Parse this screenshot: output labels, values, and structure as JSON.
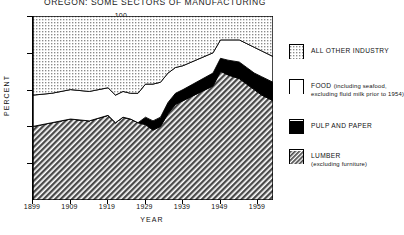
{
  "title": "OREGON: SOME SECTORS OF MANUFACTURING",
  "axes": {
    "ylabel": "PERCENT",
    "xlabel": "YEAR",
    "yticks": [
      "20",
      "40",
      "60",
      "80",
      "100"
    ],
    "xticks": [
      "1899",
      "1909",
      "1919",
      "1929",
      "1939",
      "1949",
      "1959"
    ]
  },
  "legend": [
    {
      "label": "ALL OTHER  INDUSTRY",
      "sub": "",
      "swatch": "light-dotted",
      "color": "#d9d9d9"
    },
    {
      "label": "FOOD",
      "sub": "(including seafood,",
      "sub2": "excluding  fluid milk prior to 1954)",
      "swatch": "white",
      "color": "#ffffff"
    },
    {
      "label": "PULP  AND  PAPER",
      "sub": "",
      "swatch": "solid-black",
      "color": "#000000"
    },
    {
      "label": "LUMBER",
      "sub": "(excluding furniture)",
      "swatch": "dark-hatch",
      "color": "#8f8f8f"
    }
  ],
  "chart_data": {
    "type": "area",
    "title": "OREGON: SOME SECTORS OF MANUFACTURING",
    "xlabel": "YEAR",
    "ylabel": "PERCENT",
    "xlim": [
      1899,
      1963
    ],
    "ylim": [
      0,
      100
    ],
    "grid": false,
    "stacked": true,
    "stack_total": 100,
    "legend_position": "right",
    "x": [
      1899,
      1904,
      1909,
      1914,
      1919,
      1921,
      1923,
      1925,
      1927,
      1929,
      1931,
      1933,
      1935,
      1937,
      1939,
      1947,
      1949,
      1951,
      1954,
      1956,
      1958,
      1960,
      1963
    ],
    "series": [
      {
        "name": "LUMBER (excluding furniture)",
        "values": [
          40,
          42,
          44,
          43,
          46,
          42,
          45,
          44,
          42,
          41,
          38,
          40,
          47,
          52,
          54,
          62,
          70,
          68,
          66,
          63,
          60,
          57,
          54
        ]
      },
      {
        "name": "PULP AND PAPER",
        "values": [
          0,
          0,
          0,
          0,
          0,
          0,
          0,
          0,
          0,
          4,
          5,
          5,
          6,
          6,
          6,
          7,
          7,
          8,
          9,
          9,
          9,
          10,
          10
        ]
      },
      {
        "name": "FOOD (including seafood, excluding fluid milk prior to 1954)",
        "values": [
          17,
          16,
          16,
          16,
          15,
          15,
          14,
          14,
          16,
          18,
          20,
          19,
          16,
          14,
          13,
          11,
          10,
          11,
          12,
          13,
          14,
          14,
          14
        ]
      },
      {
        "name": "ALL OTHER INDUSTRY",
        "values": [
          43,
          42,
          40,
          41,
          39,
          43,
          41,
          42,
          42,
          37,
          37,
          36,
          31,
          28,
          27,
          20,
          13,
          13,
          13,
          15,
          17,
          19,
          22
        ]
      }
    ]
  }
}
